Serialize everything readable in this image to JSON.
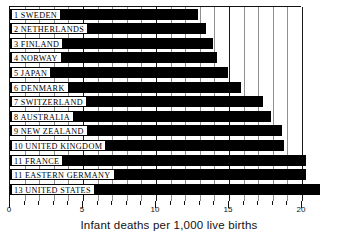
{
  "chart_data": {
    "type": "bar",
    "orientation": "horizontal",
    "title": "",
    "xlabel": "Infant deaths per 1,000 live births",
    "ylabel": "",
    "xlim": [
      0,
      20
    ],
    "xticks": [
      0,
      5,
      10,
      15,
      20
    ],
    "xticklabels": [
      "0",
      "5",
      "10",
      "15",
      "20"
    ],
    "minor_tick_interval": 1,
    "grid": true,
    "grid_axis": "x",
    "legend": "none",
    "bar_color": "#000000",
    "categories": [
      "1 SWEDEN",
      "2 NETHERLANDS",
      "3 FINLAND",
      "4 NORWAY",
      "5 JAPAN",
      "6 DENMARK",
      "7 SWITZERLAND",
      "8 AUSTRALIA",
      "9 NEW ZEALAND",
      "10 UNITED KINGDOM",
      "11 FRANCE",
      "11 EASTERN GERMANY",
      "13 UNITED STATES"
    ],
    "values": [
      12.9,
      13.4,
      13.9,
      14.2,
      14.9,
      15.8,
      17.3,
      17.9,
      18.6,
      18.8,
      20.3,
      20.3,
      21.2
    ]
  },
  "axis": {
    "caption": "Infant deaths per 1,000 live births"
  }
}
